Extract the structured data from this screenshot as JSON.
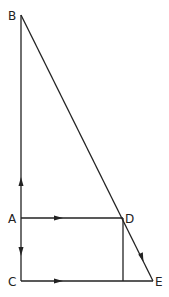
{
  "diagram": {
    "points": {
      "B": {
        "label": "B",
        "x": 21,
        "y": 15
      },
      "A": {
        "label": "A",
        "x": 21,
        "y": 218
      },
      "C": {
        "label": "C",
        "x": 21,
        "y": 281
      },
      "D": {
        "label": "D",
        "x": 123,
        "y": 218
      },
      "E": {
        "label": "E",
        "x": 153,
        "y": 281
      }
    },
    "segments": [
      "BA",
      "AC",
      "AD",
      "CE",
      "DF",
      "BE"
    ],
    "arrows": [
      {
        "on": "AB",
        "direction": "up"
      },
      {
        "on": "AC",
        "direction": "down"
      },
      {
        "on": "AD",
        "direction": "right"
      },
      {
        "on": "CE",
        "direction": "right"
      },
      {
        "on": "DE",
        "direction": "down-right"
      }
    ],
    "line_color": "#222222"
  }
}
